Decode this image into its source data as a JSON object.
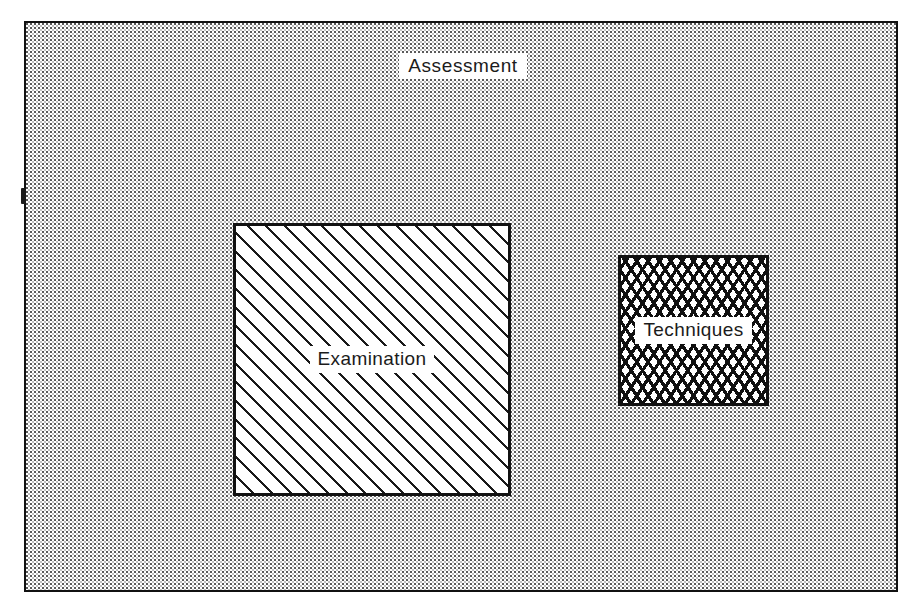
{
  "figure": {
    "type": "set-containment-diagram",
    "medium": "scanned-printed-figure",
    "canvas": {
      "width": 914,
      "height": 616
    },
    "palette": {
      "ink": "#111111",
      "paper": "#ffffff",
      "stipple_dot": "#5a5a5a",
      "hatch": "#1a1a1a",
      "crosshatch": "#101010"
    }
  },
  "outer_region": {
    "name": "assessment-region",
    "title": "Assessment",
    "fill_pattern": "dotted-stipple",
    "border": "solid-thin-black",
    "title_position": "top-center",
    "bounds": {
      "x": 24,
      "y": 21,
      "width": 874,
      "height": 571
    }
  },
  "nodes": [
    {
      "id": "examination",
      "label": "Examination",
      "fill_pattern": "diagonal-hatch-45",
      "border": "solid-thick-black",
      "relative_size": "large",
      "bounds": {
        "x": 207,
        "y": 200,
        "width": 278,
        "height": 273
      }
    },
    {
      "id": "techniques",
      "label": "Techniques",
      "fill_pattern": "diamond-cross-hatch",
      "border": "solid-thick-black",
      "relative_size": "small",
      "bounds": {
        "x": 592,
        "y": 232,
        "width": 151,
        "height": 151
      }
    }
  ],
  "artifacts": {
    "left_edge_tick": {
      "name": "left-edge-tick",
      "description": "scan registration notch on left border",
      "bounds": {
        "x": 21,
        "y": 188,
        "width": 5,
        "height": 16
      }
    }
  }
}
